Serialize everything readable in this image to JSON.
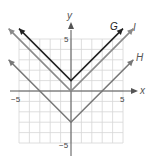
{
  "chart_data": {
    "type": "line",
    "title": "",
    "xlabel": "x",
    "ylabel": "y",
    "xlim": [
      -5,
      5
    ],
    "ylim": [
      -5,
      5
    ],
    "grid": true,
    "tick_labels": {
      "x": [
        "-5",
        "5"
      ],
      "y": [
        "5",
        "-5"
      ]
    },
    "series": [
      {
        "name": "G",
        "equation": "y = |x| + 1",
        "vertex": [
          0,
          1
        ],
        "points": [
          [
            -5,
            6
          ],
          [
            0,
            1
          ],
          [
            5,
            6
          ]
        ],
        "color": "#222222"
      },
      {
        "name": "I",
        "equation": "y = |x|",
        "vertex": [
          0,
          0
        ],
        "points": [
          [
            -6,
            6
          ],
          [
            0,
            0
          ],
          [
            6,
            6
          ]
        ],
        "color": "#8a8a8a"
      },
      {
        "name": "H",
        "equation": "y = |x| - 3",
        "vertex": [
          0,
          -3
        ],
        "points": [
          [
            -6,
            3
          ],
          [
            0,
            -3
          ],
          [
            6,
            3
          ]
        ],
        "color": "#777777"
      }
    ]
  },
  "labels": {
    "x_axis": "x",
    "y_axis": "y",
    "x_neg": "−5",
    "x_pos": "5",
    "y_pos": "5",
    "y_neg": "−5",
    "G": "G",
    "I": "I",
    "H": "H"
  }
}
